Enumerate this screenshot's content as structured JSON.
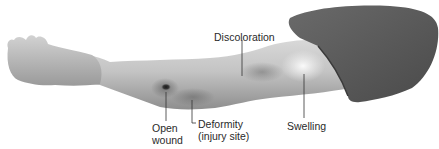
{
  "figure": {
    "labels": {
      "discoloration": "Discoloration",
      "open_wound": [
        "Open",
        "wound"
      ],
      "deformity": [
        "Deformity",
        "(injury site)"
      ],
      "swelling": "Swelling"
    },
    "colors": {
      "skin_light": "#e6e6e6",
      "skin_mid": "#b9b9b9",
      "skin_dark": "#8a8a8a",
      "sleeve": "#585858",
      "bruise": "#7a7a7a",
      "swelling": "#f4f4f4",
      "wound": "#2a2a2a",
      "leader_line": "#333333"
    }
  }
}
